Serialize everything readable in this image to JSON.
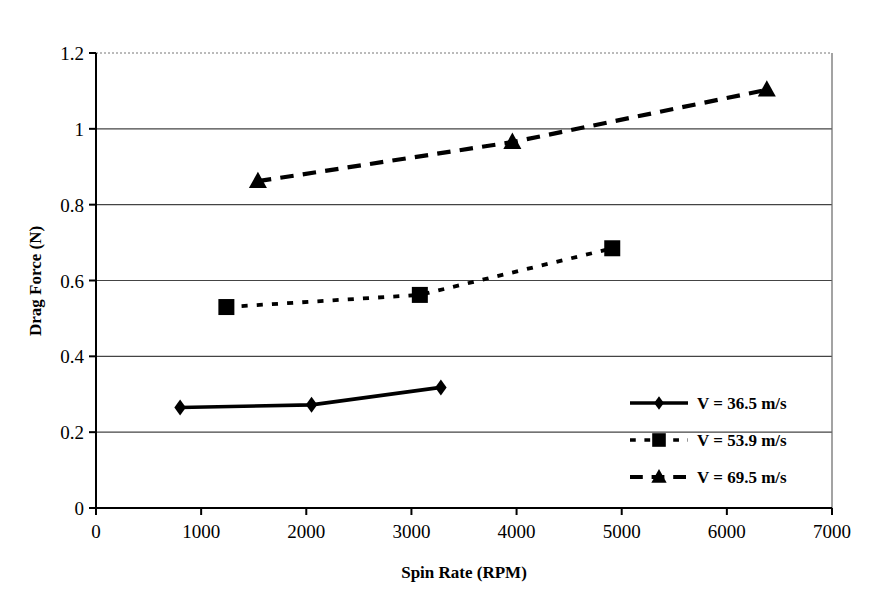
{
  "chart_data": {
    "type": "line",
    "title": "",
    "xlabel": "Spin Rate (RPM)",
    "ylabel": "Drag Force (N)",
    "xlim": [
      0,
      7000
    ],
    "ylim": [
      0,
      1.2
    ],
    "xticks": [
      "0",
      "1000",
      "2000",
      "3000",
      "4000",
      "5000",
      "6000",
      "7000"
    ],
    "yticks": [
      "0",
      "0.2",
      "0.4",
      "0.6",
      "0.8",
      "1",
      "1.2"
    ],
    "xtick_values": [
      0,
      1000,
      2000,
      3000,
      4000,
      5000,
      6000,
      7000
    ],
    "ytick_values": [
      0,
      0.2,
      0.4,
      0.6,
      0.8,
      1,
      1.2
    ],
    "grid": "horizontal",
    "legend_position": "inside-lower-right",
    "series": [
      {
        "name": "V = 36.5 m/s",
        "marker": "diamond",
        "linestyle": "solid",
        "color": "#000000",
        "x": [
          800,
          2050,
          3280
        ],
        "values": [
          0.265,
          0.272,
          0.318
        ]
      },
      {
        "name": "V = 53.9 m/s",
        "marker": "square",
        "linestyle": "dotted",
        "color": "#000000",
        "x": [
          1240,
          3080,
          4910
        ],
        "values": [
          0.53,
          0.562,
          0.685
        ]
      },
      {
        "name": "V = 69.5 m/s",
        "marker": "triangle",
        "linestyle": "dashed",
        "color": "#000000",
        "x": [
          1540,
          3960,
          6380
        ],
        "values": [
          0.862,
          0.965,
          1.103
        ]
      }
    ]
  },
  "legend": {
    "entries": [
      {
        "label": "V = 36.5 m/s",
        "marker": "diamond",
        "linestyle": "solid"
      },
      {
        "label": "V = 53.9 m/s",
        "marker": "square",
        "linestyle": "dotted"
      },
      {
        "label": "V = 69.5 m/s",
        "marker": "triangle",
        "linestyle": "dashed"
      }
    ]
  },
  "colors": {
    "ink": "#000000",
    "grid": "#555555",
    "background": "#ffffff"
  }
}
